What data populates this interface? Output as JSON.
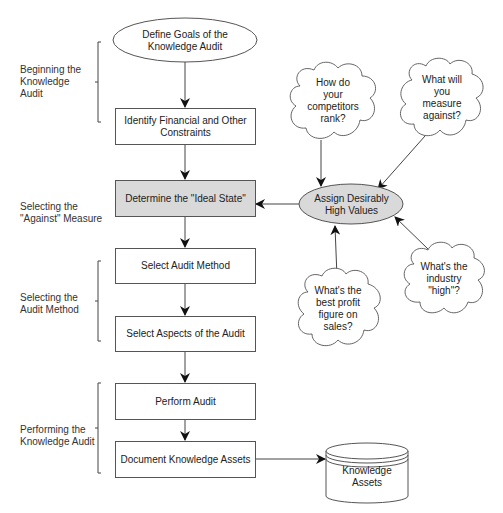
{
  "diagram": {
    "colors": {
      "line": "#555555",
      "shaded_fill": "#d9d9d9",
      "background": "#ffffff"
    },
    "stages": [
      {
        "id": "beginning",
        "label": "Beginning the\nKnowledge\nAudit"
      },
      {
        "id": "selecting-against",
        "label": "Selecting the\n\"Against\" Measure"
      },
      {
        "id": "selecting-method",
        "label": "Selecting the\nAudit Method"
      },
      {
        "id": "performing",
        "label": "Performing the\nKnowledge Audit"
      }
    ],
    "flow": [
      {
        "id": "define-goals",
        "shape": "ellipse",
        "label": "Define Goals of the\nKnowledge Audit"
      },
      {
        "id": "identify-constraints",
        "shape": "box",
        "label": "Identify Financial and Other\nConstraints"
      },
      {
        "id": "determine-ideal",
        "shape": "box-shaded",
        "label": "Determine the \"Ideal State\""
      },
      {
        "id": "select-method",
        "shape": "box",
        "label": "Select Audit Method"
      },
      {
        "id": "select-aspects",
        "shape": "box",
        "label": "Select Aspects of the Audit"
      },
      {
        "id": "perform-audit",
        "shape": "box",
        "label": "Perform Audit"
      },
      {
        "id": "document-assets",
        "shape": "box",
        "label": "Document Knowledge Assets"
      }
    ],
    "assign": {
      "shape": "ellipse-shaded",
      "label": "Assign Desirably\nHigh Values"
    },
    "clouds": [
      {
        "id": "competitors",
        "label": "How do\nyour\ncompetitors\nrank?"
      },
      {
        "id": "measure-against",
        "label": "What will\nyou\nmeasure\nagainst?"
      },
      {
        "id": "best-profit",
        "label": "What's the\nbest profit\nfigure on\nsales?"
      },
      {
        "id": "industry-high",
        "label": "What's the\nindustry\n\"high\"?"
      }
    ],
    "datastore": {
      "shape": "cylinder",
      "label": "Knowledge\nAssets"
    }
  }
}
